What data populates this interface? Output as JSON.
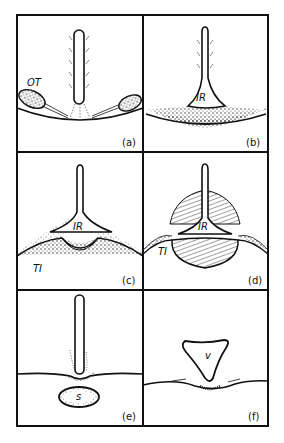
{
  "figure": {
    "panels": [
      {
        "id": "a",
        "caption": "(a)",
        "labels": [
          "OT"
        ]
      },
      {
        "id": "b",
        "caption": "(b)",
        "labels": [
          "IR"
        ]
      },
      {
        "id": "c",
        "caption": "(c)",
        "labels": [
          "IR",
          "TI"
        ]
      },
      {
        "id": "d",
        "caption": "(d)",
        "labels": [
          "IR",
          "TI"
        ]
      },
      {
        "id": "e",
        "caption": "(e)",
        "labels": [
          "s"
        ]
      },
      {
        "id": "f",
        "caption": "(f)",
        "labels": [
          "v"
        ]
      }
    ],
    "colors": {
      "ink": "#111111",
      "background": "#ffffff"
    }
  }
}
